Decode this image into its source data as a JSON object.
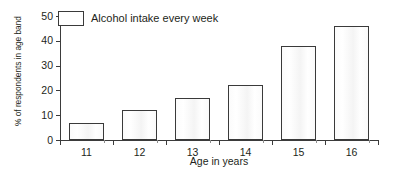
{
  "chart_data": {
    "type": "bar",
    "title": "",
    "categories": [
      "11",
      "12",
      "13",
      "14",
      "15",
      "16"
    ],
    "values": [
      7,
      12,
      17,
      22,
      38,
      46
    ],
    "series": [
      {
        "name": "Alcohol intake every week",
        "values": [
          7,
          12,
          17,
          22,
          38,
          46
        ]
      }
    ],
    "xlabel": "Age in years",
    "ylabel": "% of respondents in age band",
    "ylim": [
      0,
      50
    ],
    "yticks": [
      0,
      10,
      20,
      30,
      40,
      50
    ],
    "ytick_labels": [
      "0",
      "10",
      "20",
      "30",
      "40",
      "50"
    ],
    "grid": false,
    "legend": {
      "position": "top-left",
      "entries": [
        "Alcohol intake every week"
      ]
    },
    "colors": {
      "bar_fill": "#ffffff",
      "bar_stroke": "#3a3a3a",
      "axis": "#3b3b3b",
      "text": "#231f20"
    }
  }
}
